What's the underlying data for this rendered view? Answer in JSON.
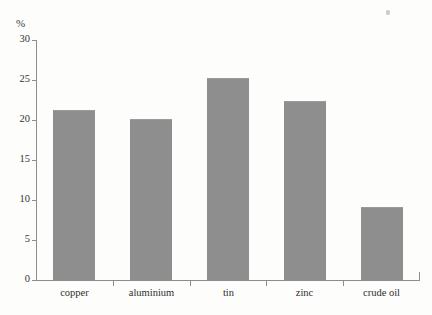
{
  "chart_data": {
    "type": "bar",
    "title": "",
    "subtitle": "",
    "xlabel": "",
    "ylabel": "%",
    "unit_label": "%",
    "categories": [
      "copper",
      "aluminium",
      "tin",
      "zinc",
      "crude oil"
    ],
    "values": [
      21.2,
      20.1,
      25.3,
      22.4,
      9.1
    ],
    "series": [
      {
        "name": "",
        "values": [
          21.2,
          20.1,
          25.3,
          22.4,
          9.1
        ]
      }
    ],
    "ylim": [
      0,
      30
    ],
    "xlim": [
      0,
      5
    ],
    "y_ticks": [
      0,
      5,
      10,
      15,
      20,
      25,
      30
    ],
    "y_tick_labels": [
      "0",
      "5",
      "10",
      "15",
      "20",
      "25",
      "30"
    ],
    "grid": false,
    "legend": false,
    "legend_position": "none",
    "bar_color": "#8e8e8e",
    "axis_color": "#8d8d8d",
    "background_color": "#fdfdfc",
    "text_color": "#2e2e2e",
    "annotations": []
  }
}
